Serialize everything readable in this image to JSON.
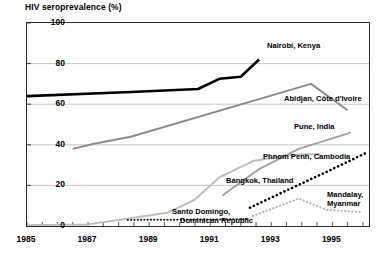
{
  "chart_data": {
    "type": "line",
    "title": "HIV seroprevalence (%)",
    "xlabel": "",
    "ylabel": "HIV seroprevalence (%)",
    "xlim": [
      1985,
      1996.2
    ],
    "ylim": [
      0,
      100
    ],
    "yticks": [
      0,
      20,
      40,
      60,
      80,
      100
    ],
    "xticks": [
      1985,
      1987,
      1989,
      1991,
      1993,
      1995
    ],
    "xtick_labels": [
      "1985",
      "1987",
      "1989",
      "1991",
      "1993",
      "1995"
    ],
    "ytick_labels": [
      "0",
      "20",
      "40",
      "60",
      "80",
      "100"
    ],
    "grid": "horizontal",
    "legend": "inline-annotations",
    "series": [
      {
        "name": "Nairobi, Kenya",
        "color": "#000000",
        "style": "solid",
        "width": 2.6,
        "points": [
          [
            1985,
            64
          ],
          [
            1988.4,
            66
          ],
          [
            1990.6,
            67.5
          ],
          [
            1991.3,
            72.5
          ],
          [
            1992.0,
            73.5
          ],
          [
            1992.6,
            82
          ]
        ]
      },
      {
        "name": "Abidjan, Côte d'Ivoire",
        "color": "#8c8c8c",
        "style": "solid",
        "width": 2.0,
        "points": [
          [
            1986.5,
            38
          ],
          [
            1987.2,
            40.5
          ],
          [
            1988.4,
            44
          ],
          [
            1994.3,
            70
          ],
          [
            1995.5,
            57
          ]
        ]
      },
      {
        "name": "Pune, India",
        "color": "#a3a3a3",
        "style": "solid",
        "width": 2.0,
        "points": [
          [
            1991.4,
            15
          ],
          [
            1992.6,
            28
          ],
          [
            1993.9,
            38
          ],
          [
            1995.6,
            46
          ]
        ]
      },
      {
        "name": "Phnom Penh, Cambodia",
        "color": "#000000",
        "style": "dotted",
        "width": 2.6,
        "points": [
          [
            1992.3,
            9
          ],
          [
            1993.0,
            14
          ],
          [
            1994.0,
            21
          ],
          [
            1995.0,
            28
          ],
          [
            1996.1,
            36
          ]
        ]
      },
      {
        "name": "Bangkok, Thailand",
        "color": "#bcbcbc",
        "style": "solid",
        "width": 2.0,
        "points": [
          [
            1985.0,
            0.4
          ],
          [
            1987.0,
            0.8
          ],
          [
            1989.6,
            6.5
          ],
          [
            1990.5,
            13
          ],
          [
            1991.3,
            24
          ],
          [
            1992.4,
            32
          ],
          [
            1993.6,
            35
          ],
          [
            1994.6,
            35.5
          ]
        ]
      },
      {
        "name": "Santo Domingo, Dominican Republic",
        "color": "#1a1a1a",
        "style": "dotted",
        "width": 2.0,
        "points": [
          [
            1988.3,
            3.0
          ],
          [
            1991.0,
            3.2
          ],
          [
            1992.2,
            3.4
          ]
        ]
      },
      {
        "name": "Mandalay, Myanmar",
        "color": "#b5b5b5",
        "style": "dotted",
        "width": 2.2,
        "points": [
          [
            1992.4,
            5
          ],
          [
            1993.2,
            9.5
          ],
          [
            1993.9,
            13.5
          ],
          [
            1994.8,
            8
          ],
          [
            1996.0,
            6.8
          ]
        ]
      }
    ],
    "annotations": [
      {
        "name": "Nairobi, Kenya",
        "x": 267,
        "y": 41
      },
      {
        "name": "Abidjan, Côte d'Ivoire",
        "x": 284,
        "y": 94
      },
      {
        "name": "Pune, India",
        "x": 294,
        "y": 122
      },
      {
        "name": "Phnom Penh, Cambodia",
        "x": 263,
        "y": 152
      },
      {
        "name": "Bangkok, Thailand",
        "x": 226,
        "y": 176
      },
      {
        "name": "Mandalay,",
        "x": 327,
        "y": 190
      },
      {
        "name": "Myanmar",
        "x": 327,
        "y": 199
      },
      {
        "name": "Santo Domingo,",
        "x": 172,
        "y": 207
      },
      {
        "name": "Dominican Republic",
        "x": 180,
        "y": 216
      }
    ]
  }
}
